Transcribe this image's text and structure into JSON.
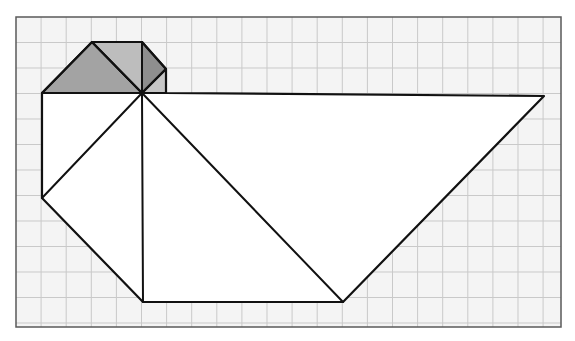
{
  "figure": {
    "colors": {
      "background": "#ffffff",
      "paper": "#f4f4f4",
      "grid_line": "#c9c9c9",
      "border": "#5a5a5a",
      "outline": "#111111",
      "shape_fill": "#ffffff",
      "shade_left": "#a3a3a3",
      "shade_middle": "#bdbdbd",
      "shade_right": "#8e8e8e",
      "shade_small": "#c6c6c6"
    },
    "grid": {
      "x0": 16,
      "y0": 17,
      "x1": 561,
      "y1": 327,
      "step_x": 25.1,
      "step_y": 25.5
    },
    "shapes": {
      "shaded": [
        {
          "name": "shaded-left-triangle",
          "points": "42,93 92,42 142,93",
          "fill_key": "shade_left"
        },
        {
          "name": "shaded-middle-triangle",
          "points": "92,42 142,42 142,93",
          "fill_key": "shade_middle"
        },
        {
          "name": "shaded-right-triangle",
          "points": "142,42 166,69 142,93",
          "fill_key": "shade_right"
        },
        {
          "name": "shaded-small-triangle",
          "points": "142,93 166,69 166,93",
          "fill_key": "shade_small"
        }
      ],
      "white": [
        {
          "name": "white-left-quad",
          "points": "42,93 142,93 42,198"
        },
        {
          "name": "white-lower-left-quad",
          "points": "42,198 142,93 143,302"
        },
        {
          "name": "white-center-triangle",
          "points": "142,93 143,302 343,302"
        },
        {
          "name": "white-right-triangle",
          "points": "142,93 544,96 343,302"
        }
      ],
      "lines": [
        {
          "name": "edge-center-to-left",
          "x1": 142,
          "y1": 93,
          "x2": 42,
          "y2": 198
        },
        {
          "name": "edge-center-vertical",
          "x1": 142,
          "y1": 93,
          "x2": 143,
          "y2": 302
        },
        {
          "name": "edge-center-to-bottom-right",
          "x1": 142,
          "y1": 93,
          "x2": 343,
          "y2": 302
        },
        {
          "name": "edge-shade-diagonal",
          "x1": 92,
          "y1": 42,
          "x2": 142,
          "y2": 93
        },
        {
          "name": "edge-shade-vertical",
          "x1": 142,
          "y1": 42,
          "x2": 142,
          "y2": 93
        },
        {
          "name": "edge-shade-right-diagonal",
          "x1": 166,
          "y1": 69,
          "x2": 142,
          "y2": 93
        }
      ],
      "outline": "42,93 92,42 142,42 166,69 166,93 544,96 343,302 143,302 42,198"
    }
  }
}
